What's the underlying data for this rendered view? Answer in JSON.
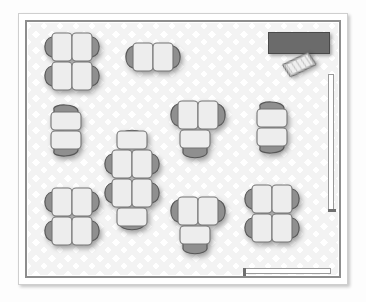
{
  "document": {
    "kind": "floor-plan",
    "title": "Classroom Layout Floor Plan",
    "view": "top-down 2D plan"
  },
  "colors": {
    "paper": "#ffffff",
    "paper_border": "#cfcfcf",
    "wall": "#8d8d8d",
    "floor_tile": "#e9e9e9",
    "blackboard": "#6b6b6b",
    "desk_top": "#ededed",
    "desk_outline": "#7d7d7d",
    "chair": "#9a9a9a",
    "chair_outline": "#5f5f5f",
    "shadow": "rgba(0,0,0,0.34)"
  },
  "room": {
    "name": "classroom",
    "wall_thickness_px": 2,
    "floor_pattern": "diamond-tile"
  },
  "fixtures": {
    "blackboard": {
      "name": "blackboard",
      "x": 268,
      "y": 32,
      "w": 62,
      "h": 22
    },
    "teacher_desk": {
      "name": "teacher-desk",
      "x": 281,
      "y": 54,
      "rotation_deg": -18
    },
    "doors": [
      {
        "name": "door-bottom",
        "orientation": "horizontal",
        "x": 243,
        "y": 268,
        "length": 88
      },
      {
        "name": "door-right",
        "orientation": "vertical",
        "x": 328,
        "y": 74,
        "length": 138
      }
    ]
  },
  "furniture": {
    "desk_unit": {
      "w": 20,
      "h": 27,
      "radius": 4
    },
    "clusters": [
      {
        "id": "cluster-1",
        "name": "desk-cluster-top-left",
        "layout": "2x2",
        "seats": 4,
        "x": 41,
        "y": 28,
        "rotation_deg": 0
      },
      {
        "id": "cluster-2",
        "name": "desk-cluster-top-center",
        "layout": "1x2",
        "seats": 2,
        "x": 122,
        "y": 41,
        "rotation_deg": 0
      },
      {
        "id": "cluster-3",
        "name": "desk-cluster-mid-left",
        "layout": "2x1",
        "seats": 2,
        "x": 45,
        "y": 105,
        "rotation_deg": 0
      },
      {
        "id": "cluster-4",
        "name": "desk-cluster-center-column",
        "layout": "2x2+2end",
        "seats": 6,
        "x": 101,
        "y": 128,
        "rotation_deg": 0
      },
      {
        "id": "cluster-5",
        "name": "desk-cluster-mid-center",
        "layout": "1x2+1",
        "seats": 3,
        "x": 167,
        "y": 99,
        "rotation_deg": 0
      },
      {
        "id": "cluster-6",
        "name": "desk-cluster-mid-right",
        "layout": "2x1",
        "seats": 2,
        "x": 251,
        "y": 102,
        "rotation_deg": 0
      },
      {
        "id": "cluster-7",
        "name": "desk-cluster-bottom-left",
        "layout": "2x2",
        "seats": 4,
        "x": 41,
        "y": 183,
        "rotation_deg": 0
      },
      {
        "id": "cluster-8",
        "name": "desk-cluster-bottom-center",
        "layout": "1x2+1",
        "seats": 3,
        "x": 167,
        "y": 195,
        "rotation_deg": 0
      },
      {
        "id": "cluster-9",
        "name": "desk-cluster-bottom-right",
        "layout": "2x2",
        "seats": 4,
        "x": 241,
        "y": 180,
        "rotation_deg": 0
      }
    ],
    "total_desks": 30
  }
}
